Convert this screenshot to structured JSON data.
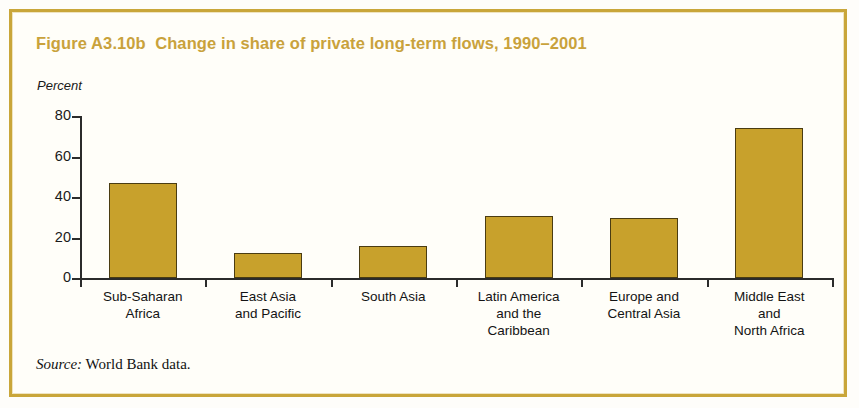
{
  "figure": {
    "title": "Figure A3.10b  Change in share of private long-term flows, 1990–2001",
    "unit_label": "Percent",
    "source_prefix": "Source:",
    "source_text": " World Bank data.",
    "frame_color": "#c9a63a",
    "title_color": "#c9a23c",
    "bar_color": "#c8a12c",
    "bar_border_color": "#4a3c12",
    "axis_color": "#2b2b2b"
  },
  "chart_data": {
    "type": "bar",
    "title": "Figure A3.10b  Change in share of private long-term flows, 1990–2001",
    "xlabel": "",
    "ylabel": "Percent",
    "ylim": [
      0,
      80
    ],
    "yticks": [
      0,
      20,
      40,
      60,
      80
    ],
    "ytick_labels": [
      "0",
      "20",
      "40",
      "60",
      "80"
    ],
    "grid": false,
    "legend": null,
    "categories": [
      "Sub-Saharan\nAfrica",
      "East Asia\nand Pacific",
      "South Asia",
      "Latin America\nand the\nCaribbean",
      "Europe and\nCentral Asia",
      "Middle East\nand\nNorth Africa"
    ],
    "values": [
      47,
      12.5,
      16,
      30.5,
      29.5,
      74
    ]
  }
}
